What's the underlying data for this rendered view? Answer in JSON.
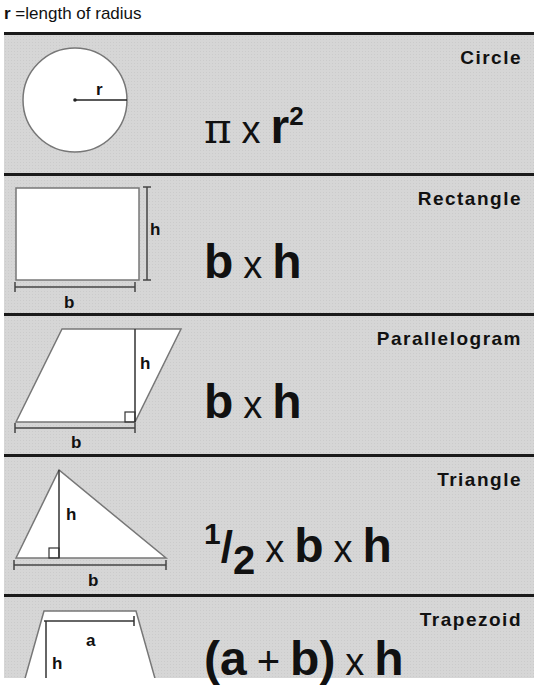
{
  "legend": {
    "symbol": "r",
    "text": "=length of radius"
  },
  "shapes": [
    {
      "name": "Circle",
      "labels": {
        "r": "r"
      },
      "formula": {
        "pi": "π",
        "times": "x",
        "var": "r",
        "exp": "2"
      }
    },
    {
      "name": "Rectangle",
      "labels": {
        "h": "h",
        "b": "b"
      },
      "formula": {
        "a": "b",
        "times": "x",
        "b": "h"
      }
    },
    {
      "name": "Parallelogram",
      "labels": {
        "h": "h",
        "b": "b"
      },
      "formula": {
        "a": "b",
        "times": "x",
        "b": "h"
      }
    },
    {
      "name": "Triangle",
      "labels": {
        "h": "h",
        "b": "b"
      },
      "formula": {
        "num": "1",
        "slash": "/",
        "den": "2",
        "times1": "x",
        "a": "b",
        "times2": "x",
        "b": "h"
      }
    },
    {
      "name": "Trapezoid",
      "labels": {
        "a": "a",
        "h": "h"
      },
      "formula": {
        "open": "(",
        "a": "a",
        "plus": "+",
        "b": "b",
        "close": ")",
        "times": "x",
        "h": "h"
      }
    }
  ],
  "colors": {
    "panel": "#d6d6d6",
    "rule": "#1a1a1a",
    "shape_fill": "#ffffff",
    "shape_stroke": "#666666"
  }
}
